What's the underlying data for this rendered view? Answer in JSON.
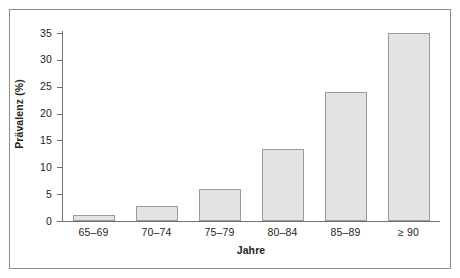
{
  "chart_data": {
    "type": "bar",
    "title": "",
    "subtitle": "",
    "xlabel": "Jahre",
    "ylabel": "Prävalenz (%)",
    "categories": [
      "65–69",
      "70–74",
      "75–79",
      "80–84",
      "85–89",
      "≥ 90"
    ],
    "values": [
      1.2,
      2.8,
      6.0,
      13.4,
      24.1,
      35.0
    ],
    "series": [
      {
        "name": "Prävalenz",
        "values": [
          1.2,
          2.8,
          6.0,
          13.4,
          24.1,
          35.0
        ]
      }
    ],
    "ylim": [
      0,
      35
    ],
    "ytick_labels": [
      "0",
      "5",
      "10",
      "15",
      "20",
      "25",
      "30",
      "35"
    ],
    "ytick_values": [
      0,
      5,
      10,
      15,
      20,
      25,
      30,
      35
    ],
    "grid": false,
    "legend": false,
    "legend_position": "none",
    "bar_fill_color": "#e3e3e3",
    "bar_border_color": "#9a9a9a",
    "axis_color": "#6f6f6f",
    "frame_color": "#8e8e8e",
    "background_color": "#ffffff",
    "text_color": "#231f20"
  }
}
